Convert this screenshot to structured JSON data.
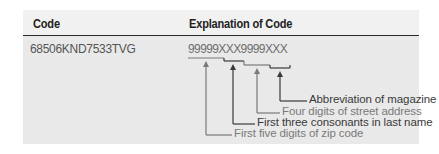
{
  "table": {
    "headers": {
      "code": "Code",
      "explanation": "Explanation of Code"
    },
    "row": {
      "code": "68506KND7533TVG",
      "pattern": "99999XXX9999XXX"
    },
    "annotations": [
      {
        "segment": "XXX",
        "label": "Abbreviation of magazine",
        "tone": "dark"
      },
      {
        "segment": "9999",
        "label": "Four digits of street address",
        "tone": "light"
      },
      {
        "segment": "XXX",
        "label": "First three consonants in last name",
        "tone": "dark"
      },
      {
        "segment": "99999",
        "label": "First five digits of zip code",
        "tone": "light"
      }
    ],
    "colors": {
      "header_bg": "#f1f1f1",
      "body_bg": "#e9e9e9",
      "rule": "#2a2a2a",
      "dark_line": "#3a3a3a",
      "light_line": "#7a7a7a"
    }
  }
}
